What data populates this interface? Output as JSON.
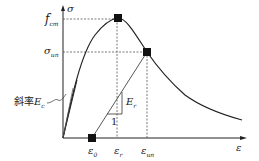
{
  "diagram": {
    "type": "stress-strain curve",
    "axes": {
      "y_label": "σ",
      "x_label": "ε"
    },
    "y_ticks": [
      {
        "main": "f",
        "sub": "cm"
      },
      {
        "main": "σ",
        "sub": "un"
      }
    ],
    "x_ticks": [
      {
        "main": "ε",
        "sub": "0"
      },
      {
        "main": "ε",
        "sub": "r"
      },
      {
        "main": "ε",
        "sub": "un"
      }
    ],
    "annotations": {
      "slope_prefix": "斜率",
      "slope_main": "E",
      "slope_sub": "c",
      "reload_main": "E",
      "reload_sub": "r",
      "unit_run": "1"
    },
    "colors": {
      "line": "#222222",
      "dashed": "#555555",
      "marker": "#111111",
      "background": "#ffffff"
    }
  }
}
